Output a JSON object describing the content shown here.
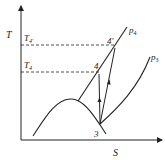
{
  "diagram": {
    "type": "T-S diagram",
    "axes": {
      "y_label": "T",
      "x_label": "S"
    },
    "levels": [
      {
        "label": "T",
        "subscript": "4'",
        "point": "4'"
      },
      {
        "label": "T",
        "subscript": "4",
        "point": "4"
      }
    ],
    "points": [
      {
        "id": "4'",
        "label": "4'"
      },
      {
        "id": "4",
        "label": "4"
      },
      {
        "id": "3",
        "label": "3"
      }
    ],
    "isobars": [
      {
        "label": "p",
        "subscript": "4"
      },
      {
        "label": "p",
        "subscript": "3"
      }
    ],
    "colors": {
      "line": "#222222",
      "background": "#ffffff"
    }
  }
}
